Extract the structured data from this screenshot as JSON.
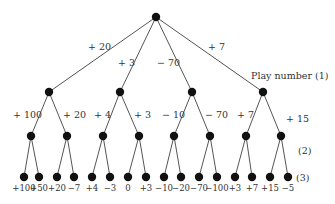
{
  "diagram": {
    "type": "game-tree",
    "root": {
      "x": 156,
      "y": 17
    },
    "level_labels": [
      {
        "text": "Play number (1)",
        "x": 251,
        "y": 79
      },
      {
        "text": "(2)",
        "x": 298,
        "y": 154
      },
      {
        "text": "(3)",
        "x": 296,
        "y": 181
      }
    ],
    "level1": [
      {
        "x": 49,
        "y": 92,
        "edge_label": "+ 20",
        "lx": 88,
        "ly": 50
      },
      {
        "x": 120,
        "y": 92,
        "edge_label": "+ 3",
        "lx": 118,
        "ly": 66
      },
      {
        "x": 192,
        "y": 92,
        "edge_label": "− 70",
        "lx": 157,
        "ly": 66
      },
      {
        "x": 263,
        "y": 92,
        "edge_label": "+ 7",
        "lx": 208,
        "ly": 50
      }
    ],
    "level2": [
      {
        "x": 31,
        "y": 136,
        "parent": 0,
        "edge_label": "+ 100",
        "lx": 13,
        "ly": 118
      },
      {
        "x": 67,
        "y": 136,
        "parent": 0,
        "edge_label": "+ 20",
        "lx": 63,
        "ly": 118
      },
      {
        "x": 103,
        "y": 136,
        "parent": 1,
        "edge_label": "+ 4",
        "lx": 94,
        "ly": 118
      },
      {
        "x": 139,
        "y": 136,
        "parent": 1,
        "edge_label": "+ 3",
        "lx": 134,
        "ly": 118
      },
      {
        "x": 174,
        "y": 136,
        "parent": 2,
        "edge_label": "− 10",
        "lx": 162,
        "ly": 118
      },
      {
        "x": 210,
        "y": 136,
        "parent": 2,
        "edge_label": "− 70",
        "lx": 205,
        "ly": 118
      },
      {
        "x": 246,
        "y": 136,
        "parent": 3,
        "edge_label": "+ 7",
        "lx": 237,
        "ly": 118
      },
      {
        "x": 281,
        "y": 136,
        "parent": 3,
        "edge_label": "+ 15",
        "lx": 286,
        "ly": 122
      }
    ],
    "leaves": [
      {
        "x": 24,
        "parent": 0,
        "label": "+100"
      },
      {
        "x": 39,
        "parent": 0,
        "label": "+50"
      },
      {
        "x": 57,
        "parent": 1,
        "label": "+20"
      },
      {
        "x": 74,
        "parent": 1,
        "label": "−7"
      },
      {
        "x": 92,
        "parent": 2,
        "label": "+4"
      },
      {
        "x": 110,
        "parent": 2,
        "label": "−3"
      },
      {
        "x": 128,
        "parent": 3,
        "label": "0"
      },
      {
        "x": 146,
        "parent": 3,
        "label": "+3"
      },
      {
        "x": 164,
        "parent": 4,
        "label": "−10"
      },
      {
        "x": 181,
        "parent": 4,
        "label": "−20"
      },
      {
        "x": 199,
        "parent": 5,
        "label": "−70"
      },
      {
        "x": 217,
        "parent": 5,
        "label": "−100"
      },
      {
        "x": 235,
        "parent": 6,
        "label": "+3"
      },
      {
        "x": 252,
        "parent": 6,
        "label": "+7"
      },
      {
        "x": 270,
        "parent": 7,
        "label": "+15"
      },
      {
        "x": 288,
        "parent": 7,
        "label": "−5"
      }
    ],
    "leaf_y": 177,
    "leaf_label_y": 191
  }
}
